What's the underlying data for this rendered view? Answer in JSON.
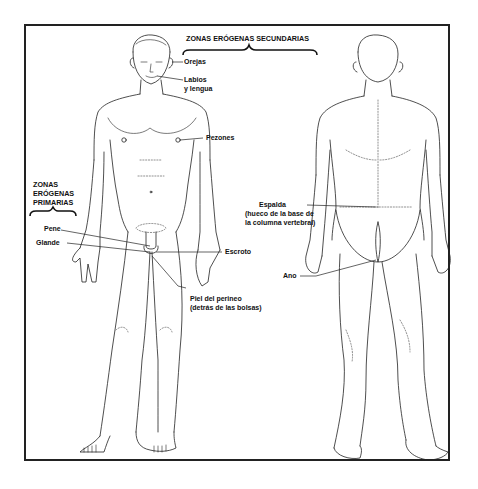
{
  "diagram": {
    "headers": {
      "secondary": "ZONAS ERÓGENAS SECUNDARIAS",
      "primary": [
        "ZONAS",
        "ERÓGENAS",
        "PRIMARIAS"
      ]
    },
    "secondary_labels": {
      "ears": "Orejas",
      "lips_1": "Labios",
      "lips_2": "y lengua",
      "nipples": "Pezones",
      "back_1": "Espalda",
      "back_2": "(hueco de la base de",
      "back_3": "la columna vertebral)",
      "anus": "Ano",
      "perineum_1": "Piel del perineo",
      "perineum_2": "(detrás de las bolsas)"
    },
    "primary_labels": {
      "penis": "Pene",
      "glans": "Glande",
      "scrotum": "Escroto"
    },
    "figures": [
      "front-view-male",
      "back-view-male"
    ],
    "colors": {
      "ink": "#222222",
      "paper": "#ffffff"
    }
  }
}
